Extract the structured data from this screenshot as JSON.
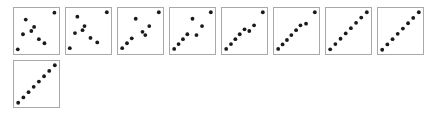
{
  "figure": {
    "title": "",
    "background_color": "#ffffff",
    "panel_border_color": "#a9a9a9",
    "dot_color": "#1a1a1a",
    "panel_count": 9,
    "panels_per_row": 8,
    "panel_width": 47,
    "panel_height": 48,
    "panel_gap_x": 5,
    "panel_gap_y": 5,
    "origin_x": 13,
    "origin_y": 7,
    "dot_radius": 1.9
  },
  "chart_data": {
    "type": "scatter",
    "title": "",
    "subtitle": "",
    "xlabel": "",
    "ylabel": "",
    "xlim": [
      0,
      1
    ],
    "ylim": [
      0,
      1
    ],
    "grid": false,
    "legend": "none",
    "annotations": [],
    "tick_labels": {
      "x": [],
      "y": []
    },
    "panels": [
      {
        "index": 1,
        "points_count": 8,
        "x": [
          0.03,
          0.23,
          0.44,
          0.16,
          0.37,
          0.56,
          0.7,
          0.95
        ],
        "y": [
          0.05,
          0.78,
          0.6,
          0.42,
          0.5,
          0.3,
          0.2,
          0.95
        ]
      },
      {
        "index": 2,
        "points_count": 8,
        "x": [
          0.03,
          0.22,
          0.4,
          0.16,
          0.35,
          0.55,
          0.72,
          0.96
        ],
        "y": [
          0.08,
          0.85,
          0.62,
          0.45,
          0.52,
          0.33,
          0.22,
          0.96
        ]
      },
      {
        "index": 3,
        "points_count": 8,
        "x": [
          0.04,
          0.16,
          0.28,
          0.38,
          0.55,
          0.62,
          0.72,
          0.96
        ],
        "y": [
          0.08,
          0.2,
          0.32,
          0.8,
          0.48,
          0.4,
          0.62,
          0.96
        ]
      },
      {
        "index": 4,
        "points_count": 8,
        "x": [
          0.04,
          0.15,
          0.26,
          0.37,
          0.5,
          0.6,
          0.74,
          0.96
        ],
        "y": [
          0.06,
          0.18,
          0.3,
          0.42,
          0.8,
          0.4,
          0.62,
          0.96
        ]
      },
      {
        "index": 5,
        "points_count": 8,
        "x": [
          0.04,
          0.16,
          0.27,
          0.38,
          0.5,
          0.62,
          0.74,
          0.96
        ],
        "y": [
          0.06,
          0.18,
          0.3,
          0.42,
          0.54,
          0.5,
          0.64,
          0.96
        ]
      },
      {
        "index": 6,
        "points_count": 8,
        "x": [
          0.04,
          0.15,
          0.26,
          0.37,
          0.49,
          0.6,
          0.74,
          0.96
        ],
        "y": [
          0.06,
          0.17,
          0.28,
          0.4,
          0.52,
          0.64,
          0.68,
          0.96
        ]
      },
      {
        "index": 7,
        "points_count": 8,
        "x": [
          0.04,
          0.17,
          0.3,
          0.43,
          0.56,
          0.69,
          0.82,
          0.96
        ],
        "y": [
          0.05,
          0.18,
          0.31,
          0.44,
          0.57,
          0.7,
          0.83,
          0.96
        ]
      },
      {
        "index": 8,
        "points_count": 8,
        "x": [
          0.04,
          0.17,
          0.3,
          0.43,
          0.56,
          0.69,
          0.82,
          0.96
        ],
        "y": [
          0.04,
          0.17,
          0.3,
          0.43,
          0.56,
          0.69,
          0.82,
          0.96
        ]
      },
      {
        "index": 9,
        "points_count": 8,
        "x": [
          0.04,
          0.17,
          0.3,
          0.43,
          0.56,
          0.69,
          0.82,
          0.96
        ],
        "y": [
          0.04,
          0.17,
          0.3,
          0.43,
          0.56,
          0.69,
          0.82,
          0.96
        ]
      }
    ]
  }
}
